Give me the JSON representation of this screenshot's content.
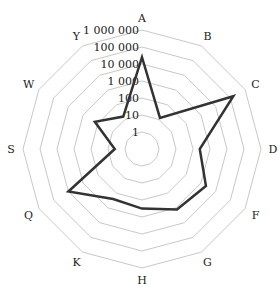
{
  "chart_data": {
    "type": "radar",
    "title": "",
    "scale": "log10",
    "axis_ticks": [
      "1",
      "10",
      "100",
      "1 000",
      "10 000",
      "100 000",
      "1 000 000"
    ],
    "categories": [
      "A",
      "B",
      "C",
      "D",
      "F",
      "G",
      "H",
      "K",
      "Q",
      "S",
      "W",
      "Y"
    ],
    "series": [
      {
        "name": "",
        "values": [
          25000,
          13,
          160000,
          250,
          2200,
          1300,
          320,
          250,
          10000,
          4,
          160,
          16
        ]
      }
    ],
    "grid": true,
    "legend": "none"
  },
  "style": {
    "grid_color": "#c8c8c8",
    "line_color": "#333333"
  }
}
